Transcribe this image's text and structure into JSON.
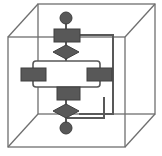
{
  "image": {
    "width": 162,
    "height": 156,
    "background": "#ffffff",
    "title": "Flowchart enclosed in wireframe cube"
  },
  "palette": {
    "shape_fill": "#585858",
    "shape_stroke": "#3f3f3f",
    "connector": "#585858",
    "cube_line": "#6f6f6f",
    "group_outline": "#585858",
    "group_fill": "#ffffff"
  },
  "cube": {
    "name": "wireframe-cube",
    "front_face": {
      "x": 8,
      "y": 37,
      "width": 117,
      "height": 110
    },
    "back_face": {
      "x": 38,
      "y": 4,
      "width": 117,
      "height": 110
    },
    "edges": [
      {
        "from": [
          8,
          37
        ],
        "to": [
          38,
          4
        ]
      },
      {
        "from": [
          125,
          37
        ],
        "to": [
          155,
          4
        ]
      },
      {
        "from": [
          8,
          147
        ],
        "to": [
          38,
          114
        ]
      },
      {
        "from": [
          125,
          147
        ],
        "to": [
          155,
          114
        ]
      }
    ]
  },
  "flowchart": {
    "name": "vertical-flowchart",
    "nodes": [
      {
        "id": "start",
        "shape": "circle",
        "label": "",
        "cx": 66,
        "cy": 18,
        "r": 6
      },
      {
        "id": "process-top",
        "shape": "rect",
        "label": "",
        "x": 54,
        "y": 29,
        "width": 26,
        "height": 13
      },
      {
        "id": "decision-top",
        "shape": "diamond",
        "label": "",
        "cx": 66,
        "cy": 52,
        "rx": 13,
        "ry": 7
      },
      {
        "id": "process-left",
        "shape": "rect",
        "label": "",
        "x": 21,
        "y": 68,
        "width": 25,
        "height": 13
      },
      {
        "id": "process-right",
        "shape": "rect",
        "label": "",
        "x": 87,
        "y": 68,
        "width": 25,
        "height": 13
      },
      {
        "id": "process-bottom",
        "shape": "rect",
        "label": "",
        "x": 57,
        "y": 87,
        "width": 23,
        "height": 13
      },
      {
        "id": "decision-bottom",
        "shape": "diamond",
        "label": "",
        "cx": 66,
        "cy": 111,
        "rx": 13,
        "ry": 7
      },
      {
        "id": "end",
        "shape": "circle",
        "label": "",
        "cx": 66,
        "cy": 128,
        "r": 6
      }
    ],
    "group_box": {
      "id": "parallel-group",
      "x": 33,
      "y": 61,
      "width": 67,
      "height": 26,
      "radius": 3
    },
    "connectors": [
      {
        "id": "start-to-process-top",
        "points": [
          [
            66,
            24
          ],
          [
            66,
            29
          ]
        ]
      },
      {
        "id": "process-top-to-decision-top",
        "points": [
          [
            66,
            42
          ],
          [
            66,
            45
          ]
        ]
      },
      {
        "id": "decision-top-to-group",
        "points": [
          [
            66,
            59
          ],
          [
            66,
            62
          ]
        ]
      },
      {
        "id": "group-to-process-bottom",
        "points": [
          [
            66,
            86
          ],
          [
            66,
            87
          ]
        ]
      },
      {
        "id": "process-bottom-to-decision-bottom",
        "points": [
          [
            66,
            100
          ],
          [
            66,
            104
          ]
        ]
      },
      {
        "id": "decision-bottom-to-end",
        "points": [
          [
            66,
            118
          ],
          [
            66,
            122
          ]
        ]
      },
      {
        "id": "loop-top-right",
        "points": [
          [
            80,
            35
          ],
          [
            113,
            35
          ],
          [
            113,
            114
          ]
        ]
      },
      {
        "id": "loop-bottom-right",
        "points": [
          [
            79,
            111
          ],
          [
            113,
            111
          ]
        ]
      },
      {
        "id": "loop-return",
        "points": [
          [
            66,
            118
          ],
          [
            104,
            118
          ],
          [
            104,
            96
          ]
        ]
      }
    ]
  }
}
